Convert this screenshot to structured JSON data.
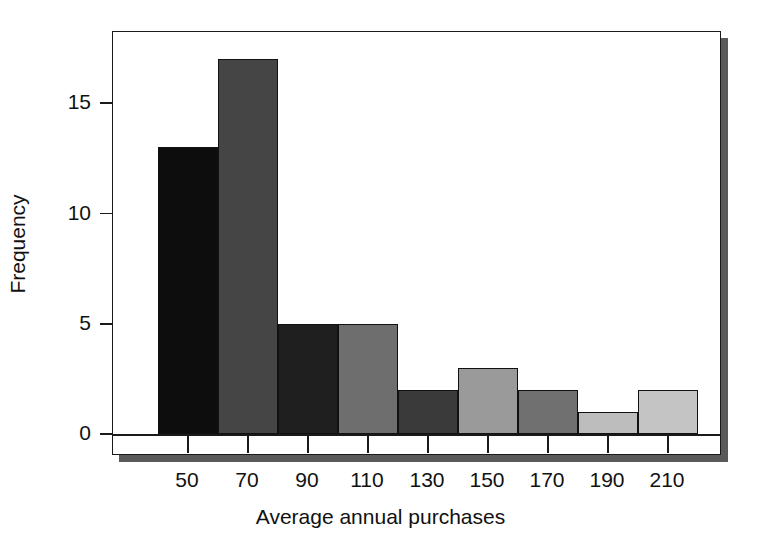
{
  "chart_data": {
    "type": "bar",
    "title": "",
    "subtitle": "",
    "xlabel": "Average annual purchases",
    "ylabel": "Frequency",
    "categories": [
      "50",
      "70",
      "90",
      "110",
      "130",
      "150",
      "170",
      "190",
      "210"
    ],
    "values": [
      13,
      17,
      5,
      5,
      2,
      3,
      2,
      1,
      2
    ],
    "bin_width": 20,
    "bar_colors": [
      "#0d0d0d",
      "#454545",
      "#1f1f1f",
      "#6e6e6e",
      "#3a3a3a",
      "#9a9a9a",
      "#707070",
      "#bdbdbd",
      "#c4c4c4"
    ],
    "xtick_labels": [
      "50",
      "70",
      "90",
      "110",
      "130",
      "150",
      "170",
      "190",
      "210"
    ],
    "ytick_labels": [
      "0",
      "5",
      "10",
      "15"
    ],
    "ytick_values": [
      0,
      5,
      10,
      15
    ],
    "ylim": [
      0,
      18.7
    ],
    "xlim": [
      40,
      220
    ],
    "grid": false,
    "legend": null,
    "frame": "box",
    "annotations": []
  },
  "axes": {
    "y_title": "Frequency",
    "x_title": "Average annual purchases"
  }
}
